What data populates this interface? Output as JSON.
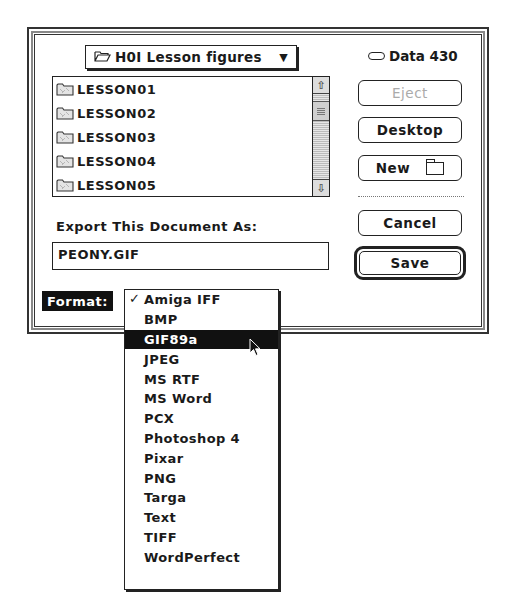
{
  "dialog": {
    "folder_popup": {
      "label": "H0I Lesson figures",
      "icon": "open-folder-icon",
      "arrow": "▼"
    },
    "volume": {
      "name": "Data 430",
      "icon": "disk-icon"
    },
    "file_list": {
      "items": [
        {
          "label": "LESSON01",
          "icon": "folder-icon"
        },
        {
          "label": "LESSON02",
          "icon": "folder-icon"
        },
        {
          "label": "LESSON03",
          "icon": "folder-icon"
        },
        {
          "label": "LESSON04",
          "icon": "folder-icon"
        },
        {
          "label": "LESSON05",
          "icon": "folder-icon"
        }
      ],
      "scroll_up": "⇧",
      "scroll_down": "⇩"
    },
    "buttons": {
      "eject": "Eject",
      "desktop": "Desktop",
      "new": "New",
      "cancel": "Cancel",
      "save": "Save"
    },
    "export_label": "Export This Document As:",
    "filename": "PEONY.GIF",
    "format": {
      "label": "Format:",
      "checked": "Amiga IFF",
      "highlighted": "GIF89a",
      "check_glyph": "✓",
      "options": [
        "Amiga IFF",
        "BMP",
        "GIF89a",
        "JPEG",
        "MS RTF",
        "MS Word",
        "PCX",
        "Photoshop 4",
        "Pixar",
        "PNG",
        "Targa",
        "Text",
        "TIFF",
        "WordPerfect"
      ]
    }
  }
}
